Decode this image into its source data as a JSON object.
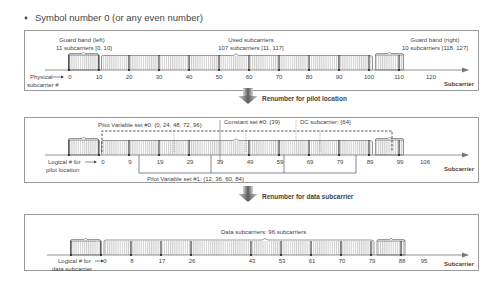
{
  "header": {
    "title": "Symbol number 0 (or any even number)"
  },
  "panel1": {
    "guard_left": {
      "line1": "Guard band (left)",
      "line2": "11 subcarriers [0, 10]"
    },
    "used": {
      "line1": "Used subcarriers",
      "line2": "107 subcarriers [11, 117]"
    },
    "guard_right": {
      "line1": "Guard band (right)",
      "line2": "10 subcarriers [118, 127]"
    },
    "axis_label_line1": "Physical",
    "axis_label_line2": "subcarrier #",
    "axis_title": "Subcarrier",
    "ticks": [
      "0",
      "10",
      "20",
      "30",
      "40",
      "50",
      "60",
      "70",
      "80",
      "90",
      "100",
      "110",
      "120"
    ]
  },
  "step1": {
    "label": "Renumber for pilot location"
  },
  "panel2": {
    "pilot_set0": "Pilot Variable set #0: {0, 24, 48, 72, 96}",
    "constant_set0": "Constant set #0: {39}",
    "dc_subcarrier": "DC subcarrier: {64}",
    "pilot_set1": "Pilot Variable set #1: {12, 36, 60, 84}",
    "axis_label_line1": "Logical # for",
    "axis_label_line2": "pilot location",
    "axis_title": "Subcarrier",
    "ticks": [
      "0",
      "9",
      "19",
      "29",
      "39",
      "49",
      "59",
      "69",
      "79",
      "89",
      "99",
      "106"
    ]
  },
  "step2": {
    "label": "Renumber for data subcarrier"
  },
  "panel3": {
    "data_label": "Data subcarriers: 96 subcarriers",
    "axis_label_line1": "Logical # for",
    "axis_label_line2": "data subcarrier",
    "axis_title": "Subcarrier",
    "ticks": [
      "0",
      "8",
      "17",
      "26",
      "43",
      "53",
      "61",
      "70",
      "79",
      "88",
      "95"
    ]
  }
}
